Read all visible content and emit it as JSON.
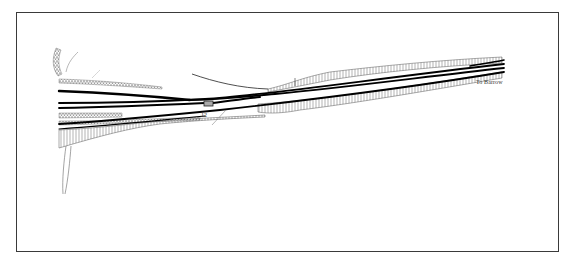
{
  "diagram": {
    "type": "railway-track-plan",
    "labels": {
      "destination": "To Barrow",
      "marker_number": "12"
    },
    "colors": {
      "frame": "#3a3a3a",
      "track": "#000000",
      "embankment": "#555555",
      "background": "#ffffff"
    }
  }
}
